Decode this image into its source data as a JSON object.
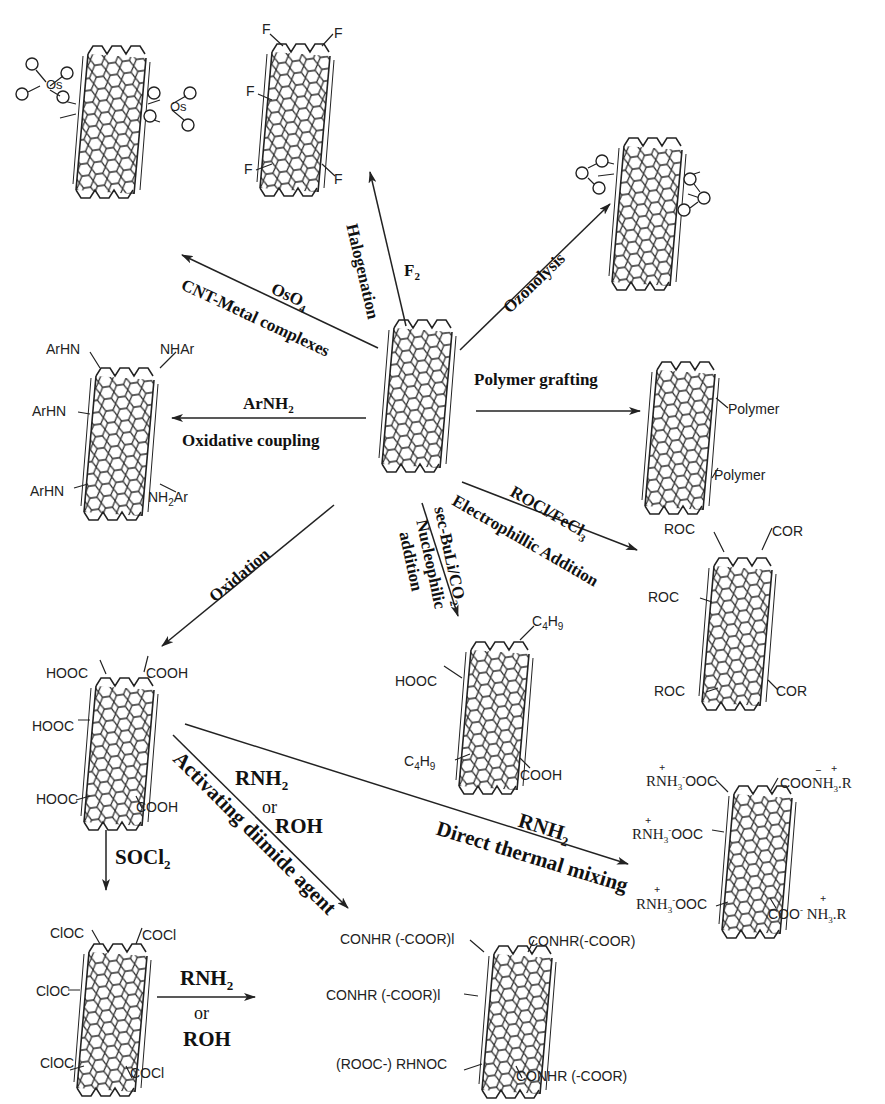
{
  "diagram": {
    "center_node": {
      "name": "pristine-cnt"
    },
    "reactions": [
      {
        "id": "halogenation",
        "reagent": "F2",
        "method": "Halogenation",
        "product": "fluorinated-cnt"
      },
      {
        "id": "osmylation",
        "reagent": "OsO4",
        "method": "CNT-Metal complexes",
        "product": "osmate-ester-cnt"
      },
      {
        "id": "ozonolysis",
        "reagent": "",
        "method": "Ozonolysis",
        "product": "ozonide-cnt"
      },
      {
        "id": "oxidative-coupling",
        "reagent": "ArNH2",
        "method": "Oxidative coupling",
        "product": "arylamine-cnt"
      },
      {
        "id": "polymer-grafting",
        "reagent": "",
        "method": "Polymer grafting",
        "product": "polymer-cnt"
      },
      {
        "id": "electrophilic-addition",
        "reagent": "ROCl/FeCl3",
        "method": "Electrophillic Addition",
        "product": "acyl-cnt"
      },
      {
        "id": "nucleophilic-addition",
        "reagent": "sec-BuLi/CO2",
        "method": "Nucleophilic addition",
        "product": "butyl-carboxyl-cnt"
      },
      {
        "id": "oxidation",
        "reagent": "",
        "method": "Oxidation",
        "product": "carboxyl-cnt"
      },
      {
        "id": "thionyl-chloride",
        "reagent": "SOCl2",
        "method": "",
        "product": "acyl-chloride-cnt"
      },
      {
        "id": "amidation-from-chloride",
        "reagent": "RNH2 or ROH",
        "method": "",
        "product": "amide-ester-cnt"
      },
      {
        "id": "activating-diimide",
        "reagent": "RNH2 or ROH",
        "method": "Activating diimide agent",
        "product": "amide-ester-cnt"
      },
      {
        "id": "direct-thermal",
        "reagent": "RNH2",
        "method": "Direct thermal mixing",
        "product": "ammonium-carboxylate-cnt"
      }
    ]
  },
  "labels": {
    "halogenation": "Halogenation",
    "f2": "F",
    "f2_sub": "2",
    "oso4_a": "OsO",
    "oso4_sub": "4",
    "cnt_metal": "CNT-Metal complexes",
    "ozonolysis": "Ozonolysis",
    "arnh2_a": "ArNH",
    "arnh2_sub": "2",
    "oxidative_coupling": "Oxidative coupling",
    "polymer_grafting": "Polymer grafting",
    "rocl_a": "ROCl/FeCl",
    "rocl_sub": "3",
    "electrophilic": "Electrophillic  Addition",
    "secbuli_a": "sec-BuLi/CO",
    "secbuli_sub": "2",
    "nucleophilic": "Nucleophilic",
    "addition": "addition",
    "oxidation": "Oxidation",
    "socl2_a": "SOCl",
    "socl2_sub": "2",
    "rnh2_a": "RNH",
    "rnh2_sub": "2",
    "or": "or",
    "roh": "ROH",
    "activating": "Activating diimide agent",
    "direct_thermal": "Direct thermal mixing"
  },
  "substituents": {
    "fluoro": [
      "F",
      "F",
      "F",
      "F",
      "F"
    ],
    "ozonide_atom": "O",
    "osmate": {
      "os": "Os",
      "o": "O"
    },
    "arylamine": {
      "tl": "ArHN",
      "tr": "NHAr",
      "ml": "ArHN",
      "bl": "ArHN",
      "br_a": "NH",
      "br_sub": "2",
      "br_b": "Ar"
    },
    "polymer": {
      "top": "Polymer",
      "bottom": "Polymer"
    },
    "acyl": {
      "tl": "ROC",
      "tr": "COR",
      "ml": "ROC",
      "bl": "ROC",
      "br": "COR"
    },
    "butyl_carboxyl": {
      "tr_a": "C",
      "tr_s1": "4",
      "tr_b": "H",
      "tr_s2": "9",
      "ml": "HOOC",
      "bl_a": "C",
      "bl_s1": "4",
      "bl_b": "H",
      "bl_s2": "9",
      "br": "COOH"
    },
    "carboxyl": {
      "tl": "HOOC",
      "tr": "COOH",
      "ml": "HOOC",
      "bl": "HOOC",
      "br": "COOH"
    },
    "acyl_chloride": {
      "tl": "ClOC",
      "tr": "COCl",
      "ml": "ClOC",
      "bl": "ClOC",
      "br": "COCl"
    },
    "amide_ester": {
      "tl": "CONHR (-COOR)l",
      "tr": "CONHR(-COOR)",
      "ml": "CONHR (-COOR)l",
      "bl": "(ROOC-) RHNOC",
      "br": "CONHR (-COOR)"
    },
    "ammonium": {
      "tl_a": "RNH",
      "tl_sub": "3",
      "tl_b": "OOC",
      "tr_a": "COO",
      "tr_b": "NH",
      "tr_sub": "3",
      "tr_c": ".R",
      "ml_a": "RNH",
      "ml_sub": "3",
      "ml_b": "OOC",
      "bl_a": "RNH",
      "bl_sub": "3",
      "bl_b": "OOC",
      "br_a": "COO",
      "br_b": "NH",
      "br_sub": "3",
      "br_c": ".R",
      "plus": "+",
      "minus": "−",
      "minus_sup": "-"
    }
  },
  "colors": {
    "ink": "#222222",
    "background": "#ffffff"
  }
}
